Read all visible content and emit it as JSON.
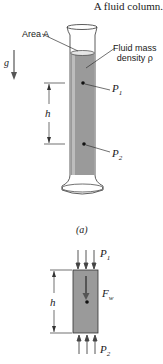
{
  "title": "A fluid column.",
  "figure_a": {
    "area_label": "Area A",
    "fluid_label_line1": "Fluid mass",
    "fluid_label_line2": "density ρ",
    "gravity_label": "g",
    "height_label": "h",
    "p1_label": "P",
    "p1_sub": "1",
    "p2_label": "P",
    "p2_sub": "2",
    "caption": "(a)"
  },
  "figure_b": {
    "height_label": "h",
    "p1_label": "P",
    "p1_sub": "1",
    "p2_label": "P",
    "p2_sub": "2",
    "weight_label": "F",
    "weight_sub": "w"
  },
  "colors": {
    "fluid": "#9a9a9a",
    "line": "#2a2a2a"
  }
}
